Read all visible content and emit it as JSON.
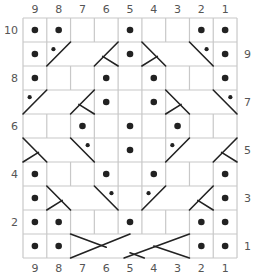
{
  "grid": {
    "columns": 9,
    "rows": 10,
    "left": 23,
    "top": 18,
    "cell_w": 23.78,
    "cell_h": 24,
    "line_color": "#c8c8c8",
    "ink_color": "#222222"
  },
  "column_labels": [
    "9",
    "8",
    "7",
    "6",
    "5",
    "4",
    "3",
    "2",
    "1"
  ],
  "row_labels_left": [
    {
      "row": 10,
      "label": "10"
    },
    {
      "row": 8,
      "label": "8"
    },
    {
      "row": 6,
      "label": "6"
    },
    {
      "row": 4,
      "label": "4"
    },
    {
      "row": 2,
      "label": "2"
    }
  ],
  "row_labels_right": [
    {
      "row": 9,
      "label": "9"
    },
    {
      "row": 7,
      "label": "7"
    },
    {
      "row": 5,
      "label": "5"
    },
    {
      "row": 3,
      "label": "3"
    },
    {
      "row": 1,
      "label": "1"
    }
  ],
  "legend_note": "dot = purl stitch; blank = knit stitch; diagonal blocks = cable crosses",
  "purl_dots": [
    {
      "row": 10,
      "cols": [
        9,
        8,
        5,
        2,
        1
      ]
    },
    {
      "row": 9,
      "cols": [
        9,
        5,
        1
      ]
    },
    {
      "row": 8,
      "cols": [
        9,
        6,
        4,
        1
      ]
    },
    {
      "row": 7,
      "cols": [
        6,
        4
      ]
    },
    {
      "row": 6,
      "cols": [
        7,
        5,
        3
      ]
    },
    {
      "row": 5,
      "cols": [
        5
      ]
    },
    {
      "row": 4,
      "cols": [
        9,
        6,
        4,
        1
      ]
    },
    {
      "row": 3,
      "cols": [
        9,
        1
      ]
    },
    {
      "row": 2,
      "cols": [
        9,
        8,
        5,
        2,
        1
      ]
    },
    {
      "row": 1,
      "cols": [
        9,
        8,
        2,
        1
      ]
    }
  ],
  "cables": [
    {
      "row": 9,
      "from_col": 8,
      "to_col": 6,
      "direction": "right-leaning",
      "purl_side": "left"
    },
    {
      "row": 9,
      "from_col": 4,
      "to_col": 2,
      "direction": "left-leaning",
      "purl_side": "right"
    },
    {
      "row": 7,
      "from_col": 9,
      "to_col": 7,
      "direction": "right-leaning",
      "purl_side": "left"
    },
    {
      "row": 7,
      "from_col": 3,
      "to_col": 1,
      "direction": "left-leaning",
      "purl_side": "right"
    },
    {
      "row": 5,
      "from_col": 9,
      "to_col": 7,
      "direction": "left-leaning",
      "purl_side": "right"
    },
    {
      "row": 5,
      "from_col": 3,
      "to_col": 1,
      "direction": "right-leaning",
      "purl_side": "left"
    },
    {
      "row": 3,
      "from_col": 8,
      "to_col": 6,
      "direction": "left-leaning",
      "purl_side": "right"
    },
    {
      "row": 3,
      "from_col": 4,
      "to_col": 2,
      "direction": "right-leaning",
      "purl_side": "left"
    },
    {
      "row": 1,
      "from_col": 7,
      "to_col": 3,
      "direction": "double-cross",
      "purl_side": "none"
    }
  ]
}
